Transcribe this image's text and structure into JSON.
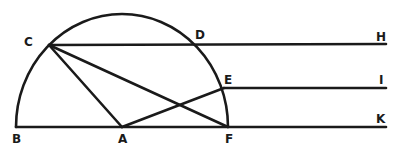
{
  "diagram": {
    "type": "geometric construction",
    "shape": "semicircle with chords and parallel lines",
    "stroke_color": "#1a1a1a",
    "background": "#ffffff",
    "points": {
      "B": {
        "label": "B",
        "x": 16,
        "y": 127
      },
      "A": {
        "label": "A",
        "x": 122,
        "y": 127
      },
      "F": {
        "label": "F",
        "x": 228,
        "y": 127
      },
      "C": {
        "label": "C",
        "x": 49,
        "y": 45
      },
      "D": {
        "label": "D",
        "x": 197,
        "y": 44
      },
      "E": {
        "label": "E",
        "x": 224,
        "y": 88
      },
      "H": {
        "label": "H",
        "x": 386,
        "y": 44
      },
      "I": {
        "label": "I",
        "x": 386,
        "y": 88
      },
      "K": {
        "label": "K",
        "x": 386,
        "y": 127
      }
    },
    "segments": [
      "B-K",
      "C-H",
      "E-I",
      "C-A",
      "C-F",
      "A-E"
    ],
    "arc": "semicircle centered at A from B to F"
  }
}
